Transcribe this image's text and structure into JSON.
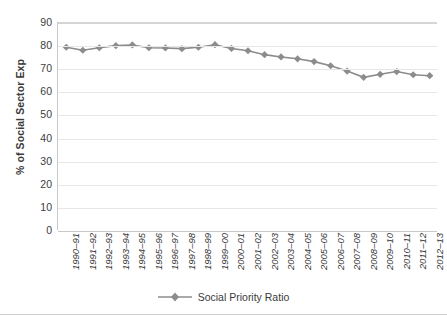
{
  "chart_data": {
    "type": "line",
    "title": "",
    "xlabel": "",
    "ylabel": "% of Social Sector Exp",
    "ylim": [
      0,
      90
    ],
    "ytick_values": [
      0,
      10,
      20,
      30,
      40,
      50,
      60,
      70,
      80,
      90
    ],
    "grid": true,
    "legend_position": "bottom",
    "categories": [
      "1990–91",
      "1991–92",
      "1992–93",
      "1993–94",
      "1994–95",
      "1995–96",
      "1996–97",
      "1997–98",
      "1998–99",
      "1999–00",
      "2000–01",
      "2001–02",
      "2002–03",
      "2003–04",
      "2004–05",
      "2005–06",
      "2006–07",
      "2007–08",
      "2008–09",
      "2009–10",
      "2010–11",
      "2011–12",
      "2012–13"
    ],
    "series": [
      {
        "name": "Social Priority Ratio",
        "color": "#8c8c8c",
        "marker": "diamond",
        "values": [
          79.5,
          78.2,
          79.3,
          80.2,
          80.5,
          79.3,
          79.2,
          78.9,
          79.5,
          80.6,
          79.0,
          78.0,
          76.3,
          75.3,
          74.5,
          73.3,
          71.5,
          69.2,
          66.5,
          67.8,
          69.0,
          67.6,
          67.2
        ]
      }
    ],
    "legend": [
      "Social Priority Ratio"
    ]
  },
  "axes": {
    "y_title": "% of Social Sector Exp"
  },
  "legend": {
    "entry_label": "Social Priority Ratio"
  }
}
